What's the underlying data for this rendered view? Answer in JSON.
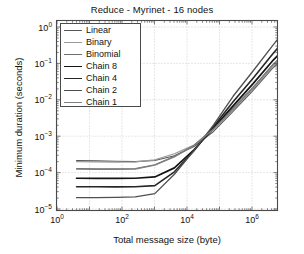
{
  "chart_data": {
    "type": "line",
    "title": "Reduce - Myrinet - 16 nodes",
    "xlabel": "Total message size (byte)",
    "ylabel": "Minimum duration (seconds)",
    "xscale": "log",
    "yscale": "log",
    "xlim": [
      1,
      20000000
    ],
    "ylim": [
      1e-05,
      2
    ],
    "grid": true,
    "legend_position": "upper left",
    "xticks": [
      "10^0",
      "10^2",
      "10^4",
      "10^6"
    ],
    "xtick_values": [
      1,
      100,
      10000,
      1000000
    ],
    "yticks": [
      "10^0",
      "10^-1",
      "10^-2",
      "10^-3",
      "10^-4",
      "10^-5"
    ],
    "ytick_values": [
      1,
      0.1,
      0.01,
      0.001,
      0.0001,
      1e-05
    ],
    "x": [
      4,
      16,
      64,
      256,
      1024,
      4096,
      16384,
      65536,
      262144,
      1048576,
      4194304,
      16777216
    ],
    "series": [
      {
        "name": "Linear",
        "color": "#555555",
        "width": 1.1,
        "values": [
          0.000215,
          0.00021,
          0.000205,
          0.0002,
          0.000215,
          0.00029,
          0.00052,
          0.00135,
          0.0048,
          0.0175,
          0.072,
          0.22
        ]
      },
      {
        "name": "Binary",
        "color": "#9a9a9a",
        "width": 1.2,
        "values": [
          0.0002,
          0.000198,
          0.000195,
          0.000196,
          0.000225,
          0.00033,
          0.00057,
          0.0015,
          0.0052,
          0.0195,
          0.078,
          0.24
        ]
      },
      {
        "name": "Binomial",
        "color": "#6e6e6e",
        "width": 1.1,
        "values": [
          0.00013,
          0.000128,
          0.000127,
          0.00013,
          0.000165,
          0.00028,
          0.00056,
          0.00165,
          0.006,
          0.0215,
          0.09,
          0.3
        ]
      },
      {
        "name": "Chain 8",
        "color": "#141414",
        "width": 1.7,
        "values": [
          7e-05,
          6.95e-05,
          6.9e-05,
          7e-05,
          7.6e-05,
          0.000135,
          0.00042,
          0.0017,
          0.0068,
          0.027,
          0.115,
          0.41
        ]
      },
      {
        "name": "Chain 4",
        "color": "#262626",
        "width": 1.6,
        "values": [
          4.1e-05,
          4.08e-05,
          4.05e-05,
          4.08e-05,
          4.4e-05,
          0.000105,
          0.0004,
          0.00185,
          0.0088,
          0.038,
          0.175,
          0.75
        ]
      },
      {
        "name": "Chain 2",
        "color": "#4f4f4f",
        "width": 1.3,
        "values": [
          2.05e-05,
          2.05e-05,
          2.08e-05,
          2.15e-05,
          2.65e-05,
          9e-05,
          0.0004,
          0.00205,
          0.0125,
          0.06,
          0.3,
          1.45
        ]
      },
      {
        "name": "Chain 1",
        "color": "#7f7f7f",
        "width": 1.2,
        "values": [
          0.000125,
          0.000123,
          0.000122,
          0.000125,
          0.00016,
          0.00027,
          0.000545,
          0.00158,
          0.0056,
          0.0205,
          0.085,
          0.27
        ]
      }
    ]
  }
}
